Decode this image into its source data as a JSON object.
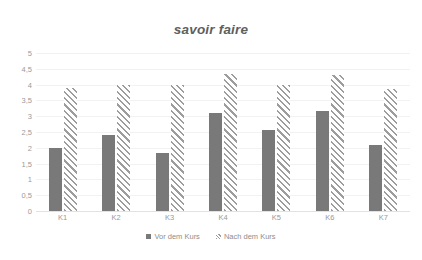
{
  "chart_data": {
    "type": "bar",
    "title": "savoir faire",
    "xlabel": "",
    "ylabel": "",
    "ylim": [
      0,
      5
    ],
    "ytick_step": 0.5,
    "ytick_labels": [
      "5",
      "4,5",
      "4",
      "3,5",
      "3",
      "2,5",
      "2",
      "1,5",
      "1",
      "0,5",
      "0"
    ],
    "ytick_values": [
      5,
      4.5,
      4,
      3.5,
      3,
      2.5,
      2,
      1.5,
      1,
      0.5,
      0
    ],
    "grid": true,
    "legend_position": "bottom",
    "categories": [
      "K1",
      "K2",
      "K3",
      "K4",
      "K5",
      "K6",
      "K7"
    ],
    "series": [
      {
        "name": "Vor dem Kurs",
        "fill": "solid",
        "color": "#797979",
        "values": [
          2.0,
          2.4,
          1.85,
          3.1,
          2.55,
          3.15,
          2.1
        ]
      },
      {
        "name": "Nach dem Kurs",
        "fill": "hatched",
        "color": "#9d9d9d",
        "values": [
          3.9,
          4.0,
          4.0,
          4.35,
          4.0,
          4.3,
          3.85
        ]
      }
    ]
  },
  "axis": {
    "y_max_label": "5",
    "y_min_label": "0"
  }
}
